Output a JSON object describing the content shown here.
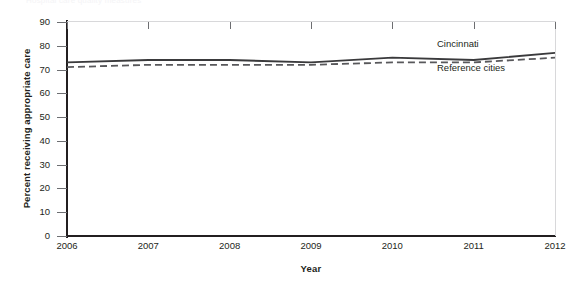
{
  "figure": {
    "cropped_header_text": "Hospital care quality measures",
    "ylabel": "Percent receiving appropriate care",
    "xlabel": "Year"
  },
  "axes": {
    "ytick_labels": [
      "90",
      "80",
      "70",
      "60",
      "50",
      "40",
      "30",
      "20",
      "10",
      "0"
    ],
    "xtick_labels": [
      "2006",
      "2007",
      "2008",
      "2009",
      "2010",
      "2011",
      "2012"
    ]
  },
  "legend": {
    "cincinnati": "Cincinnati",
    "reference_cities": "Reference cities"
  },
  "chart_data": {
    "type": "line",
    "title": "",
    "xlabel": "Year",
    "ylabel": "Percent receiving appropriate care",
    "x": [
      2006,
      2007,
      2008,
      2009,
      2010,
      2011,
      2012
    ],
    "xlim": [
      2006,
      2012
    ],
    "ylim": [
      0,
      90
    ],
    "ytick_step": 10,
    "grid": false,
    "legend_position": "inside-right",
    "series": [
      {
        "name": "Cincinnati",
        "style": "solid",
        "color": "#3a3a3c",
        "values": [
          73,
          74,
          74,
          73,
          75,
          74,
          77
        ]
      },
      {
        "name": "Reference cities",
        "style": "dashed",
        "color": "#58585b",
        "values": [
          71,
          72,
          72,
          72,
          73,
          73,
          75
        ]
      }
    ]
  }
}
